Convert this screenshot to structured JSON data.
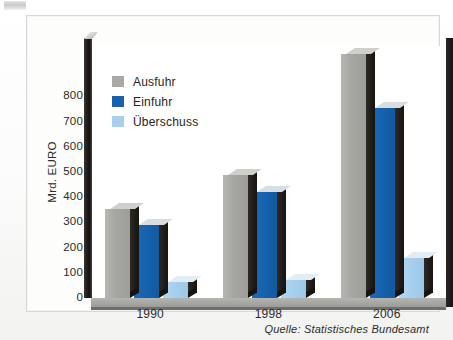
{
  "chart_data": {
    "type": "bar",
    "title": "",
    "xlabel": "",
    "ylabel": "Mrd. EURO",
    "ylim": [
      0,
      1000
    ],
    "yticks": [
      0,
      100,
      200,
      300,
      400,
      500,
      600,
      700,
      800
    ],
    "ytick_labels": [
      "0",
      "100",
      "200",
      "300",
      "400",
      "500",
      "600",
      "700",
      "800"
    ],
    "categories": [
      "1990",
      "1998",
      "2006"
    ],
    "grid": true,
    "legend_position": "upper-left",
    "series": [
      {
        "name": "Ausfuhr",
        "color": "#a9a9a6",
        "values": [
          352,
          488,
          970
        ]
      },
      {
        "name": "Einfuhr",
        "color": "#1660ad",
        "values": [
          290,
          420,
          755
        ]
      },
      {
        "name": "Überschuss",
        "color": "#a8d0ee",
        "values": [
          62,
          72,
          160
        ]
      }
    ],
    "source": "Quelle: Statistisches Bundesamt"
  },
  "legend": {
    "items": [
      {
        "label": "Ausfuhr"
      },
      {
        "label": "Einfuhr"
      },
      {
        "label": "Überschuss"
      }
    ]
  },
  "axis": {
    "y_title": "Mrd. EURO"
  },
  "footer": {
    "source": "Quelle: Statistisches Bundesamt"
  }
}
